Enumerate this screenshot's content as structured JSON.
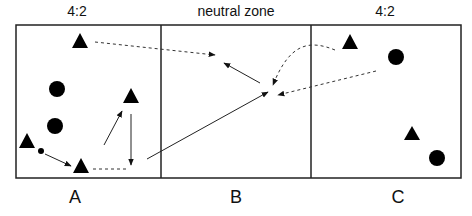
{
  "diagram": {
    "top_labels": [
      {
        "text": "4:2",
        "x": 77,
        "y": 3
      },
      {
        "text": "neutral zone",
        "x": 236,
        "y": 3
      },
      {
        "text": "4:2",
        "x": 385,
        "y": 3
      }
    ],
    "zones": [
      {
        "name": "A",
        "label": "A",
        "x": 77,
        "y": 188
      },
      {
        "name": "B",
        "label": "B",
        "x": 236,
        "y": 188
      },
      {
        "name": "C",
        "label": "C",
        "x": 384,
        "y": 188
      }
    ],
    "colors": {
      "line": "#222222",
      "marker": "#000000",
      "dashed": "#444444"
    },
    "legend": {
      "triangle": "player/attacker",
      "circle": "player/defender",
      "small_dot": "puck",
      "solid_arrow": "skate path",
      "dashed_arrow": "pass"
    }
  }
}
